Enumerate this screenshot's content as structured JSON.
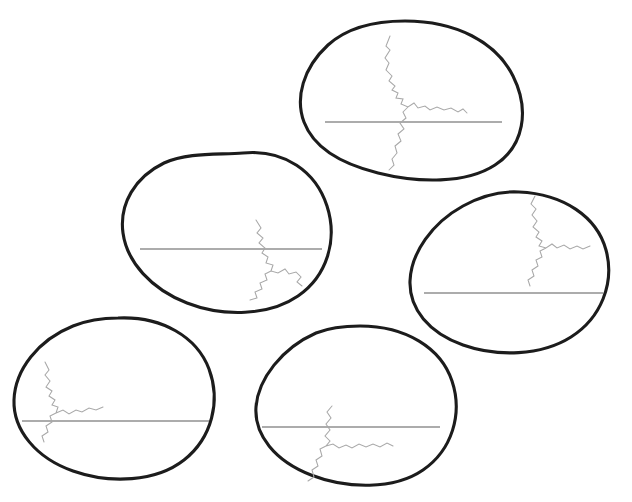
{
  "figure": {
    "title_clipped": "",
    "background_color": "#ffffff",
    "width": 632,
    "height": 502,
    "shell_color": "#1c1c1c",
    "waterline_color": "#5a5a5a",
    "crack_color": "#a8a8a8",
    "shell_stroke_width": 3.1,
    "waterline_stroke_width": 1.15,
    "crack_stroke_width": 1.05,
    "item_count": 5,
    "items": [
      {
        "id": "egg-1",
        "label": "top-egg",
        "position": "top-center",
        "center_x": 405,
        "center_y": 100,
        "rotation_deg": 14,
        "radius_x": 105,
        "radius_y": 80,
        "waterline": {
          "x1": 325,
          "y1": 122,
          "x2": 502,
          "y2": 122
        },
        "crack_region": "upper-left-of-center"
      },
      {
        "id": "egg-2",
        "label": "middle-left-egg",
        "position": "middle-left",
        "center_x": 225,
        "center_y": 233,
        "rotation_deg": 196,
        "radius_x": 104,
        "radius_y": 80,
        "waterline": {
          "x1": 140,
          "y1": 249,
          "x2": 322,
          "y2": 249
        },
        "crack_region": "right-of-center-crossing-line"
      },
      {
        "id": "egg-3",
        "label": "right-egg",
        "position": "middle-right",
        "center_x": 515,
        "center_y": 272,
        "rotation_deg": 10,
        "radius_x": 94,
        "radius_y": 80,
        "waterline": {
          "x1": 424,
          "y1": 293,
          "x2": 603,
          "y2": 293
        },
        "crack_region": "upper-right-of-center"
      },
      {
        "id": "egg-4",
        "label": "bottom-left-egg",
        "position": "bottom-left",
        "center_x": 105,
        "center_y": 398,
        "rotation_deg": 188,
        "radius_x": 104,
        "radius_y": 80,
        "waterline": {
          "x1": 22,
          "y1": 421,
          "x2": 209,
          "y2": 421
        },
        "crack_region": "left-edge-descending"
      },
      {
        "id": "egg-5",
        "label": "bottom-center-egg",
        "position": "bottom-center",
        "center_x": 357,
        "center_y": 405,
        "rotation_deg": 14,
        "radius_x": 101,
        "radius_y": 80,
        "waterline": {
          "x1": 262,
          "y1": 427,
          "x2": 440,
          "y2": 427
        },
        "crack_region": "center-crossing-line-downward"
      }
    ]
  }
}
